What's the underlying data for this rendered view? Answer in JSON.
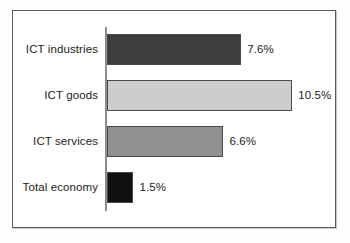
{
  "chart_data": {
    "type": "bar",
    "orientation": "horizontal",
    "title": "",
    "subtitle": "",
    "xlabel": "",
    "ylabel": "",
    "grid": false,
    "legend": "none",
    "xlim": [
      0,
      11.5
    ],
    "categories": [
      "ICT industries",
      "ICT goods",
      "ICT services",
      "Total economy"
    ],
    "values": [
      7.6,
      10.5,
      6.6,
      1.5
    ],
    "value_labels": [
      "7.6%",
      "10.5%",
      "6.6%",
      "1.5%"
    ],
    "bar_colors": [
      "#3d3d3d",
      "#cdcdcd",
      "#919191",
      "#111111"
    ],
    "bar_outline_color": "#4a4a4a",
    "axis_color": "#8d8d8d",
    "frame_color": "#5a5a5a",
    "background": "#ffffff",
    "bars": [
      {
        "category": "ICT industries",
        "value": 7.6,
        "label": "7.6%",
        "color": "#3d3d3d"
      },
      {
        "category": "ICT goods",
        "value": 10.5,
        "label": "10.5%",
        "color": "#cdcdcd"
      },
      {
        "category": "ICT services",
        "value": 6.6,
        "label": "6.6%",
        "color": "#919191"
      },
      {
        "category": "Total economy",
        "value": 1.5,
        "label": "1.5%",
        "color": "#111111"
      }
    ]
  }
}
